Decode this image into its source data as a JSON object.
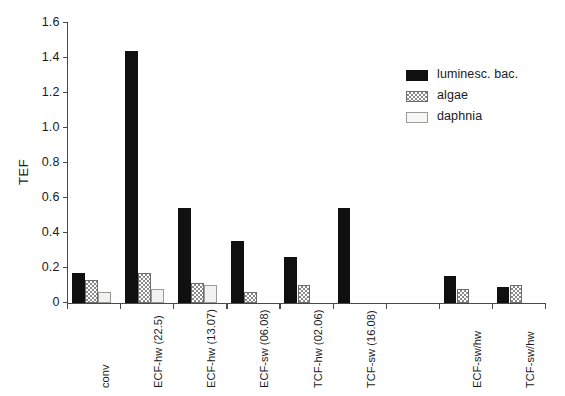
{
  "chart_data": {
    "type": "bar",
    "title": "",
    "xlabel": "",
    "ylabel": "TEF",
    "ylim": [
      0,
      1.6
    ],
    "yticks": [
      "0",
      "0.2",
      "0.4",
      "0.6",
      "0.8",
      "1.0",
      "1.2",
      "1.4",
      "1.6"
    ],
    "ytick_values": [
      0,
      0.2,
      0.4,
      0.6,
      0.8,
      1.0,
      1.2,
      1.4,
      1.6
    ],
    "grid": false,
    "legend_position": "upper-right",
    "categories": [
      "conv",
      "ECF-hw (22.5)",
      "ECF-hw (13.07)",
      "ECF-sw (06.08)",
      "TCF-hw (02.06)",
      "TCF-sw (16.08)",
      "",
      "ECF-sw/hw",
      "TCF-sw/hw"
    ],
    "series": [
      {
        "name": "luminesc. bac.",
        "color": "#101010",
        "pattern": "solid",
        "values": [
          0.17,
          1.44,
          0.54,
          0.35,
          0.26,
          0.54,
          null,
          0.15,
          0.09
        ]
      },
      {
        "name": "algae",
        "color": "#8a8a8a",
        "pattern": "checker",
        "values": [
          0.13,
          0.17,
          0.11,
          0.06,
          0.1,
          null,
          null,
          0.08,
          0.1
        ]
      },
      {
        "name": "daphnia",
        "color": "#f2f2f0",
        "pattern": "open",
        "values": [
          0.06,
          0.08,
          0.1,
          null,
          null,
          null,
          null,
          null,
          null
        ]
      }
    ]
  },
  "legend": {
    "items": [
      {
        "label": "luminesc. bac."
      },
      {
        "label": "algae"
      },
      {
        "label": "daphnia"
      }
    ]
  }
}
